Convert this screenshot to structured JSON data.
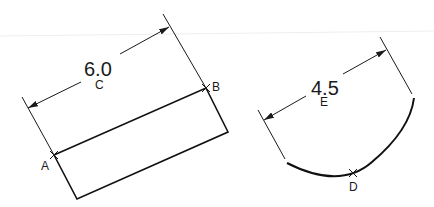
{
  "drawing": {
    "background": "#ffffff",
    "line_color": "#1a1a1a",
    "left_figure": {
      "type": "linear-dimension-on-rectangle",
      "dimension_text": "6.0",
      "center_label": "C",
      "point_labels": {
        "start": "A",
        "end": "B"
      }
    },
    "right_figure": {
      "type": "arc-dimension",
      "dimension_text": "4.5",
      "center_label": "E",
      "point_label": "D"
    }
  }
}
